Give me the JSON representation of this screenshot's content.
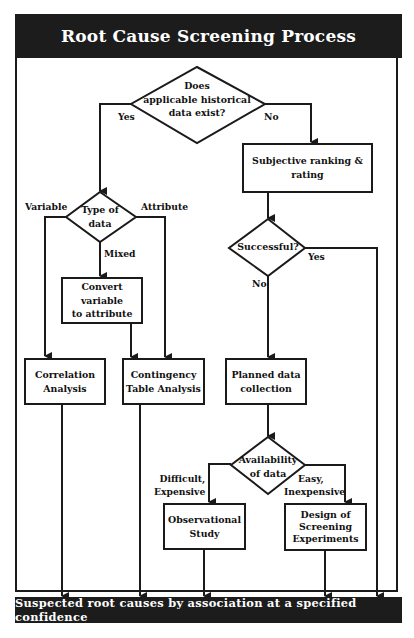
{
  "title": "Root Cause Screening Process",
  "footer": "Suspected root causes by association at a specified confidence",
  "decisions": {
    "historical": "Does applicable historical data exist?",
    "historical_lines": [
      "Does",
      "applicable historical",
      "data exist?"
    ],
    "type_of_data_lines": [
      "Type of",
      "data"
    ],
    "successful": "Successful?",
    "availability_lines": [
      "Availability",
      "of data"
    ]
  },
  "processes": {
    "subjective": "Subjective ranking & rating",
    "convert_lines": [
      "Convert variable",
      "to attribute"
    ],
    "correlation_lines": [
      "Correlation",
      "Analysis"
    ],
    "contingency_lines": [
      "Contingency",
      "Table Analysis"
    ],
    "planned_lines": [
      "Planned data",
      "collection"
    ],
    "observational_lines": [
      "Observational",
      "Study"
    ],
    "design_lines": [
      "Design of",
      "Screening",
      "Experiments"
    ]
  },
  "edge_labels": {
    "yes_1": "Yes",
    "no_1": "No",
    "variable": "Variable",
    "attribute": "Attribute",
    "mixed": "Mixed",
    "yes_2": "Yes",
    "no_2": "No",
    "difficult": [
      "Difficult,",
      "Expensive"
    ],
    "easy": [
      "Easy,",
      "Inexpensive"
    ]
  },
  "colors": {
    "ink": "#1a1a1a",
    "bar": "#1c1c1c",
    "background": "#ffffff"
  }
}
